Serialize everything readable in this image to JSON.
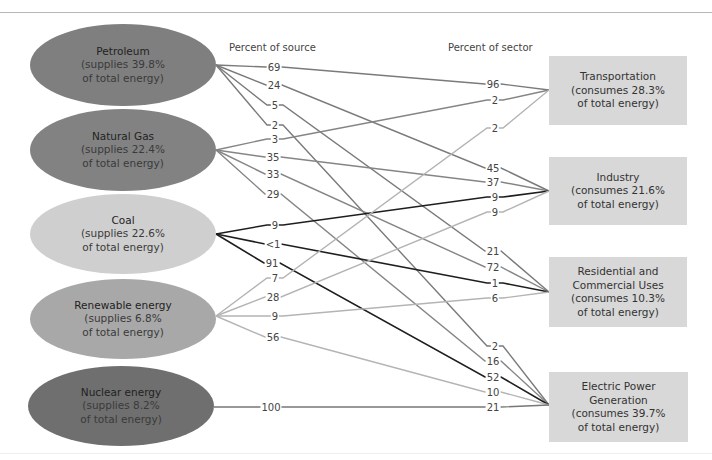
{
  "headers": {
    "percent_of_source": "Percent of source",
    "percent_of_sector": "Percent of sector"
  },
  "sources": [
    {
      "id": "petroleum",
      "name": "Petroleum",
      "line1": "(supplies 39.8%",
      "line2": "of total energy)",
      "color": "#7f7f7f",
      "line_color": "#7a7a7a"
    },
    {
      "id": "natural-gas",
      "name": "Natural Gas",
      "line1": "(supplies 22.4%",
      "line2": "of total energy)",
      "color": "#828282",
      "line_color": "#858585"
    },
    {
      "id": "coal",
      "name": "Coal",
      "line1": "(supplies 22.6%",
      "line2": "of total energy)",
      "color": "#cfcfcf",
      "line_color": "#1e1e1e"
    },
    {
      "id": "renewable",
      "name": "Renewable energy",
      "line1": "(supplies 6.8%",
      "line2": "of total energy)",
      "color": "#a8a8a8",
      "line_color": "#b4b4b4"
    },
    {
      "id": "nuclear",
      "name": "Nuclear energy",
      "line1": "(supplies 8.2%",
      "line2": "of total energy)",
      "color": "#6f6f6f",
      "line_color": "#777777"
    }
  ],
  "sectors": [
    {
      "id": "transportation",
      "name": "Transportation",
      "line1": "(consumes 28.3%",
      "line2": "of total energy)"
    },
    {
      "id": "industry",
      "name": "Industry",
      "line1": "(consumes 21.6%",
      "line2": "of total energy)"
    },
    {
      "id": "residential",
      "name": "Residential and Commercial Uses",
      "name_a": "Residential and",
      "name_b": "Commercial Uses",
      "line1": "(consumes 10.3%",
      "line2": "of total energy)"
    },
    {
      "id": "electric",
      "name": "Electric Power Generation",
      "name_a": "Electric Power",
      "name_b": "Generation",
      "line1": "(consumes 39.7%",
      "line2": "of total energy)"
    }
  ],
  "flows": [
    {
      "source": "petroleum",
      "sector": "transportation",
      "pct_source": "69",
      "pct_sector": "96"
    },
    {
      "source": "petroleum",
      "sector": "industry",
      "pct_source": "24",
      "pct_sector": "45"
    },
    {
      "source": "petroleum",
      "sector": "residential",
      "pct_source": "5",
      "pct_sector": "21"
    },
    {
      "source": "petroleum",
      "sector": "electric",
      "pct_source": "2",
      "pct_sector": "2"
    },
    {
      "source": "natural-gas",
      "sector": "transportation",
      "pct_source": "3",
      "pct_sector": "2"
    },
    {
      "source": "natural-gas",
      "sector": "industry",
      "pct_source": "35",
      "pct_sector": "37"
    },
    {
      "source": "natural-gas",
      "sector": "residential",
      "pct_source": "33",
      "pct_sector": "72"
    },
    {
      "source": "natural-gas",
      "sector": "electric",
      "pct_source": "29",
      "pct_sector": "16"
    },
    {
      "source": "coal",
      "sector": "industry",
      "pct_source": "9",
      "pct_sector": "9"
    },
    {
      "source": "coal",
      "sector": "residential",
      "pct_source": "<1",
      "pct_sector": "1"
    },
    {
      "source": "coal",
      "sector": "electric",
      "pct_source": "91",
      "pct_sector": "52"
    },
    {
      "source": "renewable",
      "sector": "transportation",
      "pct_source": "7",
      "pct_sector": "2"
    },
    {
      "source": "renewable",
      "sector": "industry",
      "pct_source": "28",
      "pct_sector": "9"
    },
    {
      "source": "renewable",
      "sector": "residential",
      "pct_source": "9",
      "pct_sector": "6"
    },
    {
      "source": "renewable",
      "sector": "electric",
      "pct_source": "56",
      "pct_sector": "10"
    },
    {
      "source": "nuclear",
      "sector": "electric",
      "pct_source": "100",
      "pct_sector": "21"
    }
  ],
  "colors": {
    "sector_box": "#d8d8d8",
    "divider": "#b8b8b8"
  }
}
